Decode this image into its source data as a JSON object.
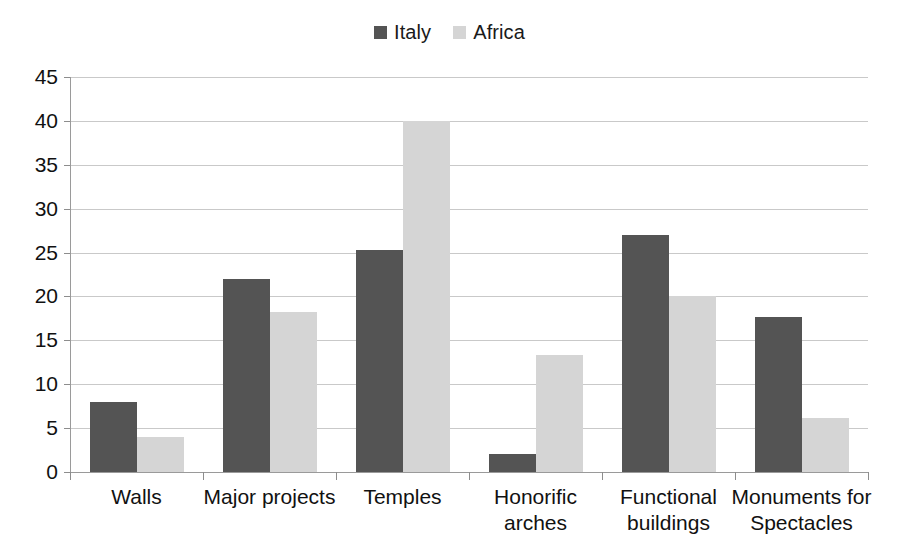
{
  "chart_data": {
    "type": "bar",
    "title": "",
    "xlabel": "",
    "ylabel": "",
    "ylim": [
      0,
      45
    ],
    "yticks": [
      0,
      5,
      10,
      15,
      20,
      25,
      30,
      35,
      40,
      45
    ],
    "grid": true,
    "legend_position": "top-center",
    "categories": [
      "Walls",
      "Major projects",
      "Temples",
      "Honorific arches",
      "Functional buildings",
      "Monuments for Spectacles"
    ],
    "category_lines": [
      [
        "Walls"
      ],
      [
        "Major projects"
      ],
      [
        "Temples"
      ],
      [
        "Honorific",
        "arches"
      ],
      [
        "Functional",
        "buildings"
      ],
      [
        "Monuments for",
        "Spectacles"
      ]
    ],
    "series": [
      {
        "name": "Italy",
        "color": "#545454",
        "values": [
          8,
          22,
          25.3,
          2,
          27,
          17.7
        ]
      },
      {
        "name": "Africa",
        "color": "#d5d5d5",
        "values": [
          4,
          18.2,
          40,
          13.3,
          20,
          6.2
        ]
      }
    ]
  },
  "legend": {
    "items": [
      {
        "label": "Italy",
        "color": "#545454",
        "icon": "square-swatch-icon"
      },
      {
        "label": "Africa",
        "color": "#d5d5d5",
        "icon": "square-swatch-icon"
      }
    ]
  }
}
